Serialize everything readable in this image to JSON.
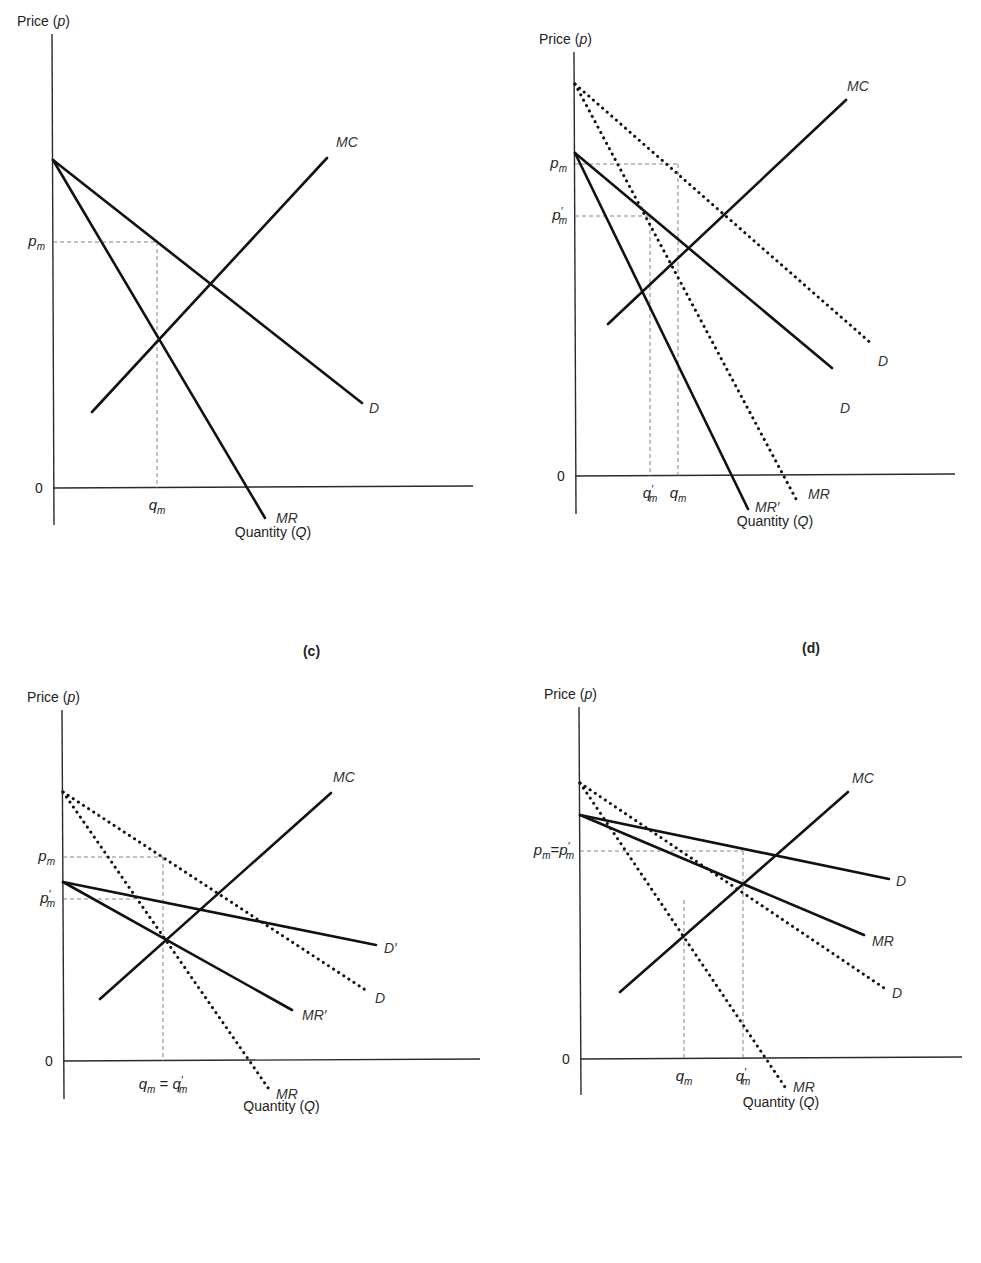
{
  "chart_data": [
    {
      "type": "line",
      "panel": "a",
      "title": "",
      "ylabel": "Price (p)",
      "xlabel": "Quantity (Q)",
      "origin_label": "0",
      "frame": {
        "x0": 53,
        "y0": 488,
        "xmax": 473,
        "ytop": 20,
        "ybottom": 525
      },
      "series": [
        {
          "name": "MC",
          "style": "solid",
          "points": [
            [
              92,
              412
            ],
            [
              327,
              158
            ]
          ],
          "label_pos": [
            336,
            147
          ]
        },
        {
          "name": "D",
          "style": "solid",
          "points": [
            [
              53,
              160
            ],
            [
              362,
              403
            ]
          ],
          "label_pos": [
            369,
            413
          ]
        },
        {
          "name": "MR",
          "style": "solid",
          "points": [
            [
              53,
              160
            ],
            [
              265,
              518
            ]
          ],
          "label_pos": [
            276,
            523
          ]
        }
      ],
      "y_ticks": [
        {
          "label": "p_m",
          "base": "p",
          "sub": "m",
          "prime": false,
          "y": 242
        }
      ],
      "x_ticks": [
        {
          "label": "q_m",
          "base": "q",
          "sub": "m",
          "prime": false,
          "x": 157
        }
      ],
      "guides": [
        {
          "from": [
            53,
            242
          ],
          "to": [
            157,
            242
          ]
        },
        {
          "from": [
            157,
            242
          ],
          "to": [
            157,
            488
          ]
        }
      ]
    },
    {
      "type": "line",
      "panel": "b",
      "title": "",
      "ylabel": "Price (p)",
      "xlabel": "Quantity (Q)",
      "origin_label": "0",
      "frame": {
        "x0": 575,
        "y0": 476,
        "xmax": 955,
        "ytop": 38,
        "ybottom": 514
      },
      "series": [
        {
          "name": "MC",
          "style": "solid",
          "points": [
            [
              608,
              324
            ],
            [
              846,
              100
            ]
          ],
          "label_pos": [
            847,
            91
          ]
        },
        {
          "name": "D",
          "style": "dotted",
          "points": [
            [
              575,
              84
            ],
            [
              873,
              345
            ]
          ],
          "label_pos": [
            878,
            366
          ]
        },
        {
          "name": "MR",
          "style": "dotted",
          "points": [
            [
              575,
              84
            ],
            [
              796,
              499
            ]
          ],
          "label_pos": [
            808,
            499
          ]
        },
        {
          "name": "D",
          "style": "solid",
          "points": [
            [
              575,
              153
            ],
            [
              832,
              368
            ]
          ],
          "label_pos": [
            840,
            413
          ]
        },
        {
          "name": "MR'",
          "style": "solid",
          "points": [
            [
              575,
              153
            ],
            [
              748,
              509
            ]
          ],
          "label_pos": [
            755,
            512
          ]
        }
      ],
      "y_ticks": [
        {
          "label": "p_m",
          "base": "p",
          "sub": "m",
          "prime": false,
          "y": 164
        },
        {
          "label": "p'_m",
          "base": "p",
          "sub": "m",
          "prime": true,
          "y": 216
        }
      ],
      "x_ticks": [
        {
          "label": "q'_m",
          "base": "q",
          "sub": "m",
          "prime": true,
          "x": 650
        },
        {
          "label": "q_m",
          "base": "q",
          "sub": "m",
          "prime": false,
          "x": 678
        }
      ],
      "guides": [
        {
          "from": [
            575,
            164
          ],
          "to": [
            678,
            164
          ]
        },
        {
          "from": [
            678,
            164
          ],
          "to": [
            678,
            476
          ]
        },
        {
          "from": [
            575,
            216
          ],
          "to": [
            650,
            216
          ]
        },
        {
          "from": [
            650,
            216
          ],
          "to": [
            650,
            476
          ]
        }
      ]
    },
    {
      "type": "line",
      "panel": "c",
      "title": "(c)",
      "ylabel": "Price (p)",
      "xlabel": "Quantity (Q)",
      "origin_label": "0",
      "frame": {
        "x0": 63,
        "y0": 1061,
        "xmax": 480,
        "ytop": 696,
        "ybottom": 1099
      },
      "series": [
        {
          "name": "MC",
          "style": "solid",
          "points": [
            [
              100,
              999
            ],
            [
              331,
              793
            ]
          ],
          "label_pos": [
            333,
            782
          ]
        },
        {
          "name": "D",
          "style": "dotted",
          "points": [
            [
              63,
              792
            ],
            [
              367,
              991
            ]
          ],
          "label_pos": [
            375,
            1003
          ]
        },
        {
          "name": "MR",
          "style": "dotted",
          "points": [
            [
              63,
              792
            ],
            [
              271,
              1092
            ]
          ],
          "label_pos": [
            276,
            1099
          ]
        },
        {
          "name": "D'",
          "style": "solid",
          "points": [
            [
              63,
              882
            ],
            [
              376,
              945
            ]
          ],
          "label_pos": [
            384,
            953
          ]
        },
        {
          "name": "MR'",
          "style": "solid",
          "points": [
            [
              63,
              882
            ],
            [
              292,
              1010
            ]
          ],
          "label_pos": [
            302,
            1020
          ]
        }
      ],
      "y_ticks": [
        {
          "label": "p_m",
          "base": "p",
          "sub": "m",
          "prime": false,
          "y": 857
        },
        {
          "label": "p'_m",
          "base": "p",
          "sub": "m",
          "prime": true,
          "y": 899
        }
      ],
      "x_ticks": [
        {
          "label": "q_m = q'_m",
          "x": 163,
          "compound": true
        }
      ],
      "guides": [
        {
          "from": [
            63,
            857
          ],
          "to": [
            163,
            857
          ]
        },
        {
          "from": [
            163,
            857
          ],
          "to": [
            163,
            1061
          ]
        },
        {
          "from": [
            63,
            899
          ],
          "to": [
            135,
            899
          ]
        }
      ]
    },
    {
      "type": "line",
      "panel": "d",
      "title": "(d)",
      "ylabel": "Price (p)",
      "xlabel": "Quantity (Q)",
      "origin_label": "0",
      "frame": {
        "x0": 580,
        "y0": 1059,
        "xmax": 962,
        "ytop": 693,
        "ybottom": 1095
      },
      "series": [
        {
          "name": "MC",
          "style": "solid",
          "points": [
            [
              620,
              992
            ],
            [
              848,
              792
            ]
          ],
          "label_pos": [
            852,
            783
          ]
        },
        {
          "name": "D",
          "style": "solid",
          "points": [
            [
              580,
              815
            ],
            [
              889,
              879
            ]
          ],
          "label_pos": [
            896,
            886
          ]
        },
        {
          "name": "MR",
          "style": "solid",
          "points": [
            [
              580,
              815
            ],
            [
              864,
              935
            ]
          ],
          "label_pos": [
            872,
            946
          ]
        },
        {
          "name": "D",
          "style": "dotted",
          "points": [
            [
              580,
              783
            ],
            [
              884,
              988
            ]
          ],
          "label_pos": [
            892,
            998
          ]
        },
        {
          "name": "MR",
          "style": "dotted",
          "points": [
            [
              580,
              783
            ],
            [
              787,
              1090
            ]
          ],
          "label_pos": [
            793,
            1092
          ]
        }
      ],
      "y_ticks": [
        {
          "label": "p_m = p'_m",
          "y": 851,
          "compound": true
        }
      ],
      "x_ticks": [
        {
          "label": "q_m",
          "base": "q",
          "sub": "m",
          "prime": false,
          "x": 684
        },
        {
          "label": "q'_m",
          "base": "q",
          "sub": "m",
          "prime": true,
          "x": 743
        }
      ],
      "guides": [
        {
          "from": [
            580,
            851
          ],
          "to": [
            743,
            851
          ]
        },
        {
          "from": [
            684,
            900
          ],
          "to": [
            684,
            1059
          ]
        },
        {
          "from": [
            743,
            851
          ],
          "to": [
            743,
            1059
          ]
        }
      ]
    }
  ],
  "panels": {
    "a": {
      "ylabel": "Price (p)",
      "xlabel": "Quantity (Q)",
      "zero": "0"
    },
    "b": {
      "ylabel": "Price (p)",
      "xlabel": "Quantity (Q)",
      "zero": "0"
    },
    "c": {
      "title": "(c)",
      "ylabel": "Price (p)",
      "xlabel": "Quantity (Q)",
      "zero": "0"
    },
    "d": {
      "title": "(d)",
      "ylabel": "Price (p)",
      "xlabel": "Quantity (Q)",
      "zero": "0"
    }
  }
}
